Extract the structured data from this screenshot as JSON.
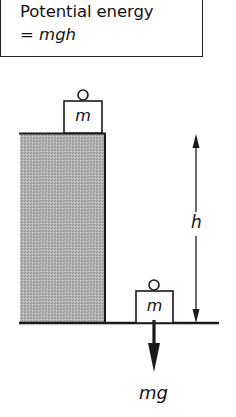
{
  "formula": {
    "line1": "Potential energy",
    "line2_prefix": "= ",
    "line2_expr": "mgh"
  },
  "labels": {
    "mass_top": "m",
    "mass_bottom": "m",
    "height": "h",
    "weight": "mg"
  },
  "colors": {
    "stroke": "#1a1a1a",
    "block_fill": "#a9a9a9",
    "background": "#ffffff"
  }
}
